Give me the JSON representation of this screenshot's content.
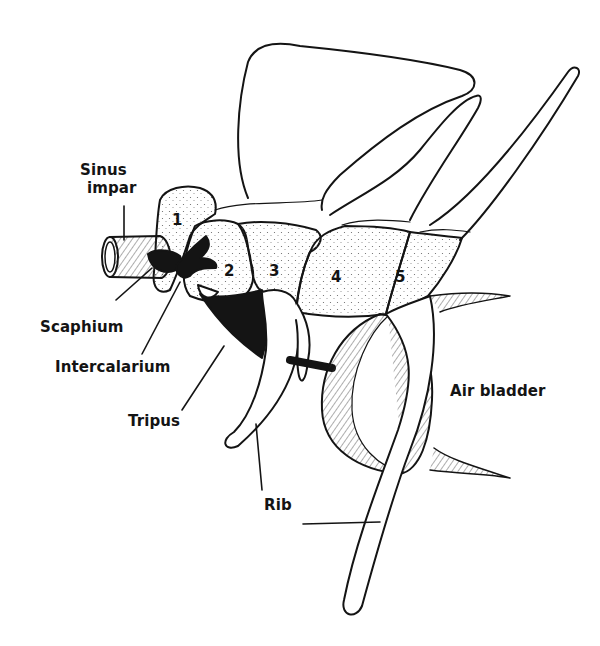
{
  "figure": {
    "colors": {
      "ink": "#141414",
      "background": "#ffffff",
      "stipple": "#555555"
    },
    "labels": {
      "sinus_impar_line1": "Sinus",
      "sinus_impar_line2": "impar",
      "scaphium": "Scaphium",
      "intercalarium": "Intercalarium",
      "tripus": "Tripus",
      "rib": "Rib",
      "air_bladder": "Air bladder"
    },
    "vertebrae": [
      {
        "number": "1"
      },
      {
        "number": "2"
      },
      {
        "number": "3"
      },
      {
        "number": "4"
      },
      {
        "number": "5"
      }
    ]
  }
}
